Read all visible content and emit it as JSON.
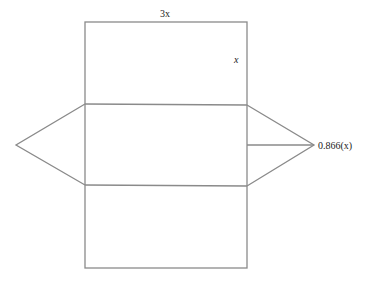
{
  "diagram": {
    "type": "net-of-triangular-prism",
    "labels": {
      "top_width": "3x",
      "side_height": "x",
      "triangle_height": "0.866(x)"
    },
    "colors": {
      "stroke": "#8a8a8a",
      "text": "#222222"
    }
  }
}
